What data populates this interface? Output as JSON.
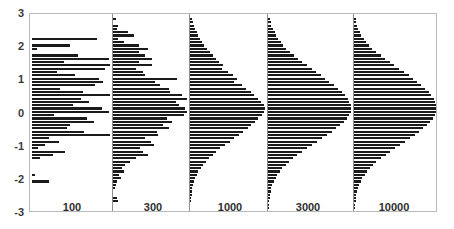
{
  "figure": {
    "title": "",
    "background": "#ffffff",
    "bar_color": "#1b1b1b",
    "frame_color": "#b9b9b9",
    "baseline_color": "#8f8f8f",
    "axis_label_color": "#3a3a3a"
  },
  "layout": {
    "plot_left": 29,
    "plot_top": 13,
    "plot_right": 437,
    "plot_bottom": 212,
    "panel_baselines_px": [
      30,
      111,
      188,
      266,
      352
    ],
    "panel_width_px": 81,
    "xlabel_y": 201,
    "xlabel_offset_px": 42
  },
  "yaxis": {
    "label": "",
    "min": -3,
    "max": 3,
    "ticks": [
      3,
      2,
      1,
      0,
      -1,
      -2,
      -3
    ],
    "tick_labels": [
      "3",
      "2",
      "1",
      "0",
      "-1",
      "-2",
      "-3"
    ]
  },
  "xaxis": {
    "label": "",
    "tick_labels": [
      "100",
      "300",
      "1000",
      "3000",
      "10000"
    ]
  },
  "chart_data": {
    "type": "bar",
    "orientation": "horizontal",
    "title": "",
    "subtitle": "",
    "xlabel": "",
    "ylabel": "",
    "ylim": [
      -3,
      3
    ],
    "grid": false,
    "legend": null,
    "legend_position": "none",
    "annotations": [],
    "panels": [
      {
        "name": "100",
        "sample_size": 100,
        "y": [
          2.85,
          2.75,
          2.65,
          2.55,
          2.45,
          2.35,
          2.25,
          2.15,
          2.05,
          1.95,
          1.85,
          1.75,
          1.65,
          1.55,
          1.45,
          1.35,
          1.25,
          1.15,
          1.05,
          0.95,
          0.85,
          0.75,
          0.65,
          0.55,
          0.45,
          0.35,
          0.25,
          0.15,
          0.05,
          -0.05,
          -0.15,
          -0.25,
          -0.35,
          -0.45,
          -0.55,
          -0.65,
          -0.75,
          -0.85,
          -0.95,
          -1.05,
          -1.15,
          -1.25,
          -1.35,
          -1.45,
          -1.55,
          -1.65,
          -1.75,
          -1.85,
          -1.95,
          -2.05,
          -2.15,
          -2.25,
          -2.35,
          -2.45,
          -2.55,
          -2.65,
          -2.75,
          -2.85
        ],
        "values": [
          0,
          0,
          0,
          0,
          0,
          0,
          0.82,
          0,
          0.48,
          0.06,
          0,
          0.58,
          0.97,
          0.4,
          1.0,
          0.93,
          0.32,
          0.55,
          0.85,
          0.9,
          0.8,
          0.35,
          0.65,
          1.0,
          0.62,
          0.72,
          0.52,
          0.88,
          0.98,
          0.28,
          0.7,
          0.78,
          0.48,
          0.44,
          0.66,
          1.02,
          0.22,
          0.34,
          0.16,
          0.08,
          0.42,
          0.26,
          0.1,
          0,
          0,
          0,
          0,
          0.04,
          0,
          0.22,
          0,
          0,
          0,
          0,
          0,
          0,
          0,
          0
        ]
      },
      {
        "name": "300",
        "sample_size": 300,
        "y": [
          2.85,
          2.75,
          2.65,
          2.55,
          2.45,
          2.35,
          2.25,
          2.15,
          2.05,
          1.95,
          1.85,
          1.75,
          1.65,
          1.55,
          1.45,
          1.35,
          1.25,
          1.15,
          1.05,
          0.95,
          0.85,
          0.75,
          0.65,
          0.55,
          0.45,
          0.35,
          0.25,
          0.15,
          0.05,
          -0.05,
          -0.15,
          -0.25,
          -0.35,
          -0.45,
          -0.55,
          -0.65,
          -0.75,
          -0.85,
          -0.95,
          -1.05,
          -1.15,
          -1.25,
          -1.35,
          -1.45,
          -1.55,
          -1.65,
          -1.75,
          -1.85,
          -1.95,
          -2.05,
          -2.15,
          -2.25,
          -2.35,
          -2.45,
          -2.55,
          -2.65,
          -2.75,
          -2.85
        ],
        "values": [
          0.04,
          0,
          0.07,
          0.05,
          0.2,
          0.28,
          0.07,
          0.15,
          0.34,
          0.46,
          0.34,
          0.42,
          0.52,
          0.35,
          0.52,
          0.3,
          0.4,
          0.43,
          0.85,
          0.56,
          0.62,
          0.74,
          0.76,
          0.92,
          0.98,
          0.84,
          0.88,
          0.96,
          1.0,
          0.95,
          0.72,
          0.78,
          0.66,
          0.74,
          0.58,
          0.6,
          0.42,
          0.5,
          0.55,
          0.36,
          0.4,
          0.46,
          0.3,
          0.22,
          0.16,
          0.12,
          0.14,
          0.08,
          0.1,
          0.05,
          0.04,
          0.03,
          0,
          0,
          0.05,
          0.06,
          0,
          0
        ]
      },
      {
        "name": "1000",
        "sample_size": 1000,
        "y": [
          2.85,
          2.75,
          2.65,
          2.55,
          2.45,
          2.35,
          2.25,
          2.15,
          2.05,
          1.95,
          1.85,
          1.75,
          1.65,
          1.55,
          1.45,
          1.35,
          1.25,
          1.15,
          1.05,
          0.95,
          0.85,
          0.75,
          0.65,
          0.55,
          0.45,
          0.35,
          0.25,
          0.15,
          0.05,
          -0.05,
          -0.15,
          -0.25,
          -0.35,
          -0.45,
          -0.55,
          -0.65,
          -0.75,
          -0.85,
          -0.95,
          -1.05,
          -1.15,
          -1.25,
          -1.35,
          -1.45,
          -1.55,
          -1.65,
          -1.75,
          -1.85,
          -1.95,
          -2.05,
          -2.15,
          -2.25,
          -2.35,
          -2.45,
          -2.55,
          -2.65,
          -2.75,
          -2.85
        ],
        "values": [
          0.03,
          0.04,
          0.05,
          0.07,
          0.09,
          0.11,
          0.13,
          0.16,
          0.19,
          0.23,
          0.26,
          0.3,
          0.34,
          0.38,
          0.44,
          0.42,
          0.5,
          0.56,
          0.62,
          0.58,
          0.68,
          0.74,
          0.8,
          0.84,
          0.9,
          0.94,
          0.97,
          1.0,
          0.98,
          0.95,
          0.9,
          0.86,
          0.8,
          0.76,
          0.7,
          0.64,
          0.58,
          0.52,
          0.46,
          0.4,
          0.34,
          0.3,
          0.25,
          0.21,
          0.17,
          0.14,
          0.11,
          0.09,
          0.07,
          0.05,
          0.04,
          0.03,
          0.02,
          0.02,
          0.01,
          0.01,
          0,
          0
        ]
      },
      {
        "name": "3000",
        "sample_size": 3000,
        "y": [
          2.85,
          2.75,
          2.65,
          2.55,
          2.45,
          2.35,
          2.25,
          2.15,
          2.05,
          1.95,
          1.85,
          1.75,
          1.65,
          1.55,
          1.45,
          1.35,
          1.25,
          1.15,
          1.05,
          0.95,
          0.85,
          0.75,
          0.65,
          0.55,
          0.45,
          0.35,
          0.25,
          0.15,
          0.05,
          -0.05,
          -0.15,
          -0.25,
          -0.35,
          -0.45,
          -0.55,
          -0.65,
          -0.75,
          -0.85,
          -0.95,
          -1.05,
          -1.15,
          -1.25,
          -1.35,
          -1.45,
          -1.55,
          -1.65,
          -1.75,
          -1.85,
          -1.95,
          -2.05,
          -2.15,
          -2.25,
          -2.35,
          -2.45,
          -2.55,
          -2.65,
          -2.75,
          -2.85
        ],
        "values": [
          0.02,
          0.03,
          0.04,
          0.06,
          0.08,
          0.1,
          0.12,
          0.15,
          0.18,
          0.22,
          0.26,
          0.31,
          0.36,
          0.41,
          0.46,
          0.52,
          0.57,
          0.63,
          0.68,
          0.73,
          0.78,
          0.83,
          0.88,
          0.92,
          0.95,
          0.97,
          0.99,
          1.0,
          0.99,
          0.97,
          0.94,
          0.9,
          0.86,
          0.81,
          0.76,
          0.7,
          0.64,
          0.58,
          0.52,
          0.46,
          0.4,
          0.35,
          0.3,
          0.25,
          0.21,
          0.17,
          0.14,
          0.11,
          0.09,
          0.07,
          0.05,
          0.04,
          0.03,
          0.02,
          0.02,
          0.01,
          0.01,
          0.01
        ]
      },
      {
        "name": "10000",
        "sample_size": 10000,
        "y": [
          2.85,
          2.75,
          2.65,
          2.55,
          2.45,
          2.35,
          2.25,
          2.15,
          2.05,
          1.95,
          1.85,
          1.75,
          1.65,
          1.55,
          1.45,
          1.35,
          1.25,
          1.15,
          1.05,
          0.95,
          0.85,
          0.75,
          0.65,
          0.55,
          0.45,
          0.35,
          0.25,
          0.15,
          0.05,
          -0.05,
          -0.15,
          -0.25,
          -0.35,
          -0.45,
          -0.55,
          -0.65,
          -0.75,
          -0.85,
          -0.95,
          -1.05,
          -1.15,
          -1.25,
          -1.35,
          -1.45,
          -1.55,
          -1.65,
          -1.75,
          -1.85,
          -1.95,
          -2.05,
          -2.15,
          -2.25,
          -2.35,
          -2.45,
          -2.55,
          -2.65,
          -2.75,
          -2.85
        ],
        "values": [
          0.02,
          0.03,
          0.04,
          0.05,
          0.07,
          0.09,
          0.12,
          0.15,
          0.18,
          0.22,
          0.27,
          0.32,
          0.37,
          0.43,
          0.48,
          0.54,
          0.6,
          0.66,
          0.71,
          0.76,
          0.81,
          0.86,
          0.9,
          0.93,
          0.96,
          0.98,
          0.99,
          1.0,
          0.99,
          0.97,
          0.95,
          0.92,
          0.88,
          0.83,
          0.78,
          0.73,
          0.67,
          0.61,
          0.55,
          0.49,
          0.43,
          0.38,
          0.32,
          0.27,
          0.23,
          0.19,
          0.16,
          0.13,
          0.1,
          0.08,
          0.06,
          0.05,
          0.04,
          0.03,
          0.02,
          0.02,
          0.01,
          0.01
        ]
      }
    ]
  }
}
